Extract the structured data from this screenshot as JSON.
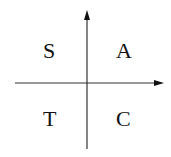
{
  "diagram": {
    "type": "quadrant",
    "quadrants": {
      "top_left": "S",
      "top_right": "A",
      "bottom_left": "T",
      "bottom_right": "C"
    },
    "axes": {
      "horizontal_arrow": "right",
      "vertical_arrow": "up"
    },
    "colors": {
      "line": "#222222",
      "background": "#ffffff"
    }
  }
}
